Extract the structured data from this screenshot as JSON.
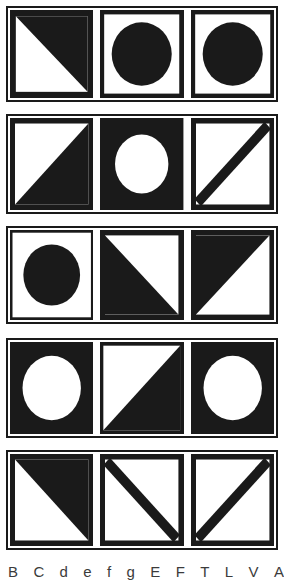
{
  "sheet": {
    "title": "geometric-figure-sheet",
    "background_color": "#ffffff",
    "ink_color": "#1a1a1a",
    "width": 284,
    "height": 580,
    "rows": 5,
    "columns": 3
  },
  "panels": [
    {
      "index": 1,
      "name": "panel-row-1",
      "x": 6,
      "y": 6,
      "width": 272,
      "height": 96,
      "cells": [
        {
          "index": 1,
          "name": "cell-r1c1",
          "figure": "triangle-filled-upper-right",
          "fill": "black",
          "ground": "white",
          "border": "thick"
        },
        {
          "index": 2,
          "name": "cell-r1c2",
          "figure": "circle-filled",
          "fill": "black",
          "ground": "white",
          "border": "thick"
        },
        {
          "index": 3,
          "name": "cell-r1c3",
          "figure": "circle-filled",
          "fill": "black",
          "ground": "white",
          "border": "thick"
        }
      ]
    },
    {
      "index": 2,
      "name": "panel-row-2",
      "x": 6,
      "y": 114,
      "width": 272,
      "height": 100,
      "cells": [
        {
          "index": 1,
          "name": "cell-r2c1",
          "figure": "triangle-filled-lower-right",
          "fill": "black",
          "ground": "white",
          "border": "thick"
        },
        {
          "index": 2,
          "name": "cell-r2c2",
          "figure": "circle-hollow-on-black",
          "fill": "white",
          "ground": "black",
          "border": "thick"
        },
        {
          "index": 3,
          "name": "cell-r2c3",
          "figure": "diagonal-line-bottomleft-topright",
          "fill": "black",
          "ground": "white",
          "border": "thick"
        }
      ]
    },
    {
      "index": 3,
      "name": "panel-row-3",
      "x": 6,
      "y": 226,
      "width": 272,
      "height": 98,
      "cells": [
        {
          "index": 1,
          "name": "cell-r3c1",
          "figure": "circle-filled",
          "fill": "black",
          "ground": "white",
          "border": "thin"
        },
        {
          "index": 2,
          "name": "cell-r3c2",
          "figure": "triangle-filled-lower-left",
          "fill": "black",
          "ground": "white",
          "border": "thick"
        },
        {
          "index": 3,
          "name": "cell-r3c3",
          "figure": "triangle-filled-upper-left",
          "fill": "black",
          "ground": "white",
          "border": "thick"
        }
      ]
    },
    {
      "index": 4,
      "name": "panel-row-4",
      "x": 6,
      "y": 338,
      "width": 272,
      "height": 100,
      "cells": [
        {
          "index": 1,
          "name": "cell-r4c1",
          "figure": "circle-hollow-on-black",
          "fill": "white",
          "ground": "black",
          "border": "thick"
        },
        {
          "index": 2,
          "name": "cell-r4c2",
          "figure": "triangle-filled-lower-right",
          "fill": "black",
          "ground": "white",
          "border": "thick"
        },
        {
          "index": 3,
          "name": "cell-r4c3",
          "figure": "circle-hollow-on-black",
          "fill": "white",
          "ground": "black",
          "border": "thick"
        }
      ]
    },
    {
      "index": 5,
      "name": "panel-row-5",
      "x": 6,
      "y": 450,
      "width": 272,
      "height": 100,
      "cells": [
        {
          "index": 1,
          "name": "cell-r5c1",
          "figure": "triangle-filled-upper-right",
          "fill": "black",
          "ground": "white",
          "border": "thick"
        },
        {
          "index": 2,
          "name": "cell-r5c2",
          "figure": "diagonal-line-topleft-bottomright",
          "fill": "black",
          "ground": "white",
          "border": "thick"
        },
        {
          "index": 3,
          "name": "cell-r5c3",
          "figure": "diagonal-line-bottomleft-topright",
          "fill": "black",
          "ground": "white",
          "border": "thick"
        }
      ]
    }
  ],
  "caption": {
    "note": "row of characters clipped by the bottom edge of the image; only the tops of the glyphs are visible",
    "glyphs": [
      "B",
      "C",
      "d",
      "e",
      "f",
      "g",
      "E",
      "F",
      "T",
      "L",
      "V",
      "A"
    ]
  }
}
